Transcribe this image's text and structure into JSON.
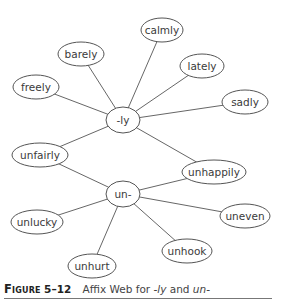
{
  "diagram": {
    "nodes": [
      {
        "id": "ly",
        "label": "-ly",
        "cx": 123,
        "cy": 120,
        "rx": 17,
        "ry": 13
      },
      {
        "id": "un",
        "label": "un-",
        "cx": 123,
        "cy": 194,
        "rx": 17,
        "ry": 13
      },
      {
        "id": "calmly",
        "label": "calmly",
        "cx": 162,
        "cy": 30,
        "rx": 21,
        "ry": 12
      },
      {
        "id": "lately",
        "label": "lately",
        "cx": 202,
        "cy": 66,
        "rx": 22,
        "ry": 12
      },
      {
        "id": "sadly",
        "label": "sadly",
        "cx": 245,
        "cy": 102,
        "rx": 23,
        "ry": 12
      },
      {
        "id": "barely",
        "label": "barely",
        "cx": 81,
        "cy": 54,
        "rx": 23,
        "ry": 12
      },
      {
        "id": "freely",
        "label": "freely",
        "cx": 36,
        "cy": 87,
        "rx": 23,
        "ry": 12
      },
      {
        "id": "unfairly",
        "label": "unfairly",
        "cx": 40,
        "cy": 155,
        "rx": 28,
        "ry": 12
      },
      {
        "id": "unhappily",
        "label": "unhappily",
        "cx": 214,
        "cy": 172,
        "rx": 32,
        "ry": 12
      },
      {
        "id": "unlucky",
        "label": "unlucky",
        "cx": 37,
        "cy": 222,
        "rx": 26,
        "ry": 12
      },
      {
        "id": "uneven",
        "label": "uneven",
        "cx": 245,
        "cy": 216,
        "rx": 25,
        "ry": 12
      },
      {
        "id": "unhook",
        "label": "unhook",
        "cx": 187,
        "cy": 251,
        "rx": 25,
        "ry": 12
      },
      {
        "id": "unhurt",
        "label": "unhurt",
        "cx": 92,
        "cy": 266,
        "rx": 24,
        "ry": 12
      }
    ],
    "edges": [
      [
        "ly",
        "calmly"
      ],
      [
        "ly",
        "lately"
      ],
      [
        "ly",
        "sadly"
      ],
      [
        "ly",
        "barely"
      ],
      [
        "ly",
        "freely"
      ],
      [
        "ly",
        "unfairly"
      ],
      [
        "ly",
        "unhappily"
      ],
      [
        "un",
        "unfairly"
      ],
      [
        "un",
        "unhappily"
      ],
      [
        "un",
        "unlucky"
      ],
      [
        "un",
        "uneven"
      ],
      [
        "un",
        "unhook"
      ],
      [
        "un",
        "unhurt"
      ]
    ]
  },
  "caption": {
    "figure_label": "Figure",
    "figure_number": "5–12",
    "text_prefix": "Affix Web for ",
    "term1": "-ly",
    "text_mid": " and ",
    "term2": "un-"
  }
}
